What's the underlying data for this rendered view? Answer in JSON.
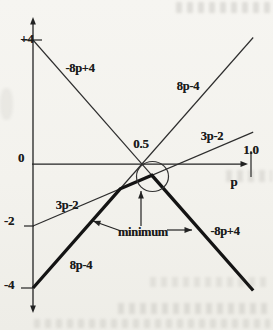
{
  "chart_data": {
    "type": "line",
    "title": "",
    "xlabel": "p",
    "ylabel": "",
    "x_range": [
      0,
      1.05
    ],
    "y_range": [
      -4.7,
      4.7
    ],
    "grid": false,
    "legend": "none (labels placed along lines)",
    "x_ticks": [
      {
        "p": 0.5,
        "label": "0.5"
      },
      {
        "p": 1.0,
        "label": "1.0"
      }
    ],
    "y_ticks": [
      {
        "v": 4,
        "label": "+4"
      },
      {
        "v": 0,
        "label": "0"
      },
      {
        "v": -2,
        "label": "-2"
      },
      {
        "v": -4,
        "label": "-4"
      }
    ],
    "series": [
      {
        "name": "-8p+4",
        "expr": "-8p+4",
        "width": "thin",
        "points": [
          [
            0,
            4
          ],
          [
            0.5455,
            -0.364
          ]
        ]
      },
      {
        "name": "8p-4",
        "expr": "8p-4",
        "width": "thin",
        "points": [
          [
            0.385,
            -0.92
          ],
          [
            1.01,
            4.08
          ]
        ]
      },
      {
        "name": "3p-2",
        "expr": "3p-2",
        "width": "thin",
        "points": [
          [
            0,
            -2
          ],
          [
            1.01,
            1.03
          ]
        ]
      },
      {
        "name": "minimum-envelope",
        "expr": "min(-8p+4, 8p-4, 3p-2)",
        "width": "thick",
        "points": [
          [
            0,
            -4
          ],
          [
            0.4,
            -0.8
          ],
          [
            0.5455,
            -0.364
          ],
          [
            1.01,
            -4.08
          ]
        ]
      }
    ],
    "labels": {
      "neg8p4_upper": "-8p+4",
      "p8p4_upper": "8p-4",
      "p3p2_right": "3p-2",
      "p3p2_left": "3p-2",
      "p8p4_lower": "8p-4",
      "neg8p4_lower": "-8p+4",
      "minimum": "minimum"
    },
    "annotations": {
      "highlight_circle": {
        "center_px": [
          152.5,
          176.5
        ],
        "rx": 16,
        "ry": 15
      },
      "arrows_px": [
        {
          "from": [
            141,
            226
          ],
          "to": [
            141,
            191
          ]
        },
        {
          "from": [
            121,
            231
          ],
          "to": [
            93,
            221
          ]
        },
        {
          "from": [
            167,
            230
          ],
          "to": [
            192,
            230
          ]
        }
      ]
    },
    "layout": {
      "origin_px": [
        33,
        164
      ],
      "px_per_x_unit": 218,
      "px_per_y_unit": 31,
      "x_axis_end_px": 248,
      "y_axis_top_px": 17,
      "y_axis_bottom_px": 313,
      "tick_marks_px": [
        [
          22,
          40,
          42,
          40
        ],
        [
          24,
          226,
          34,
          226
        ],
        [
          21,
          288,
          33,
          288
        ],
        [
          251,
          151,
          251,
          177
        ]
      ]
    }
  }
}
